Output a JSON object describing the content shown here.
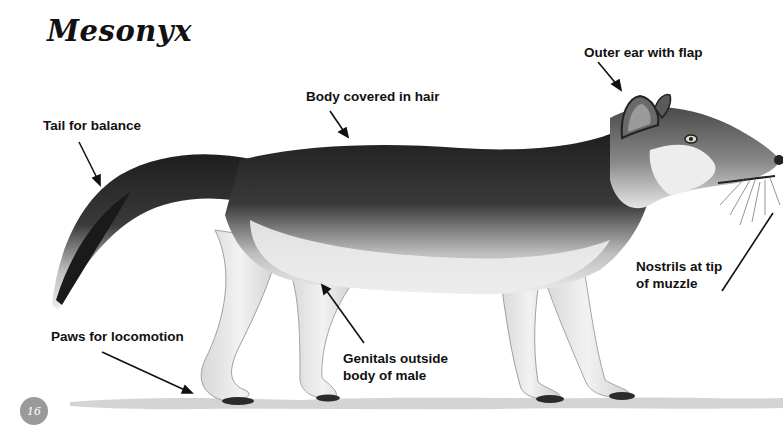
{
  "title": "Mesonyx",
  "page_number": "16",
  "labels": {
    "outer_ear": "Outer ear with flap",
    "body_hair": "Body covered in hair",
    "tail": "Tail for balance",
    "nostrils_line1": "Nostrils at tip",
    "nostrils_line2": "of muzzle",
    "paws": "Paws for locomotion",
    "genitals_line1": "Genitals outside",
    "genitals_line2": "body of male"
  },
  "colors": {
    "background": "#ffffff",
    "text": "#111111",
    "fur_dark": "#2a2a2a",
    "fur_light": "#e8e8e8",
    "page_badge": "#9a9a9a"
  }
}
